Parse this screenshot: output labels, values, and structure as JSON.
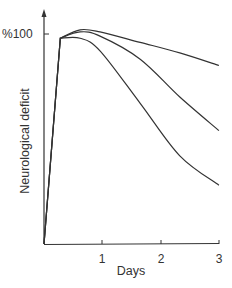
{
  "chart_data": {
    "type": "line",
    "title": "",
    "xlabel": "Days",
    "ylabel": "Neurological deficit",
    "x_ticks": [
      "1",
      "2",
      "3"
    ],
    "y_ticks": [
      "%100"
    ],
    "xlim": [
      0,
      3
    ],
    "ylim": [
      0,
      110
    ],
    "grid": false,
    "legend": null,
    "series": [
      {
        "name": "curve-top",
        "x": [
          0,
          0.28,
          0.62,
          0.96,
          1.65,
          2.33,
          3.0
        ],
        "y": [
          0,
          98,
          102,
          101,
          96,
          91,
          85
        ]
      },
      {
        "name": "curve-middle",
        "x": [
          0,
          0.28,
          0.62,
          0.96,
          1.65,
          2.33,
          3.0
        ],
        "y": [
          0,
          98,
          101,
          99,
          88,
          70,
          54
        ]
      },
      {
        "name": "curve-bottom",
        "x": [
          0,
          0.28,
          0.62,
          0.96,
          1.65,
          2.33,
          3.0
        ],
        "y": [
          0,
          98,
          98,
          92,
          67,
          42,
          28
        ]
      }
    ],
    "line_color": "#333333"
  },
  "labels": {
    "ylabel": "Neurological deficit",
    "xlabel": "Days",
    "ytick_100": "%100",
    "xtick_1": "1",
    "xtick_2": "2",
    "xtick_3": "3"
  }
}
